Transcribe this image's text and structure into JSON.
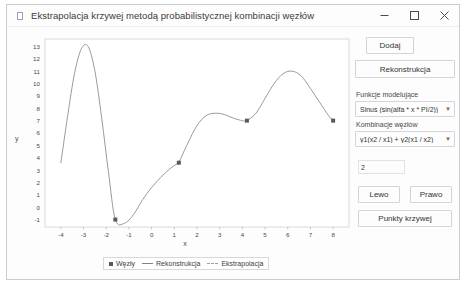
{
  "window": {
    "title": "Ekstrapolacja krzywej metodą probabilistycznej kombinacji węzłów",
    "app_icon": "app-icon",
    "controls": {
      "minimize": "minimize-icon",
      "maximize": "maximize-icon",
      "close": "close-icon"
    }
  },
  "panel": {
    "add_label": "Dodaj",
    "reconstruct_label": "Rekonstrukcja",
    "model_functions_label": "Funkcje modelujące",
    "model_functions_value": "Sinus (sin(alfa * x * PI/2))",
    "node_combination_label": "Kombinacje węzłów",
    "node_combination_value": "y1(x2 / x1) + y2(x1 / x2)",
    "spinner_value": "2",
    "left_label": "Lewo",
    "right_label": "Prawo",
    "curve_points_label": "Punkty krzywej",
    "dropdown_arrow": "chevron-down-icon"
  },
  "chart_data": {
    "type": "line",
    "title": "",
    "xlabel": "x",
    "ylabel": "y",
    "xlim": [
      -4.7,
      8.7
    ],
    "ylim": [
      -1.6,
      13.6
    ],
    "xticks": [
      -4,
      -3,
      -2,
      -1,
      0,
      1,
      2,
      3,
      4,
      5,
      6,
      7,
      8
    ],
    "yticks": [
      -1,
      0,
      1,
      2,
      3,
      4,
      5,
      6,
      7,
      8,
      9,
      10,
      11,
      12,
      13
    ],
    "grid": false,
    "legend_position": "bottom",
    "series": [
      {
        "name": "Węzły",
        "type": "scatter",
        "marker": "square",
        "color": "#555a60",
        "points": [
          {
            "x": -1.6,
            "y": -1.0
          },
          {
            "x": 1.2,
            "y": 3.6
          },
          {
            "x": 4.2,
            "y": 7.0
          },
          {
            "x": 8.0,
            "y": 7.0
          }
        ]
      },
      {
        "name": "Rekonstrukcja",
        "type": "line",
        "color": "#8a8f94",
        "x": [
          -4.0,
          -3.7,
          -3.4,
          -3.1,
          -2.8,
          -2.5,
          -2.2,
          -1.9,
          -1.6,
          -1.2,
          -0.8,
          -0.4,
          0.0,
          0.4,
          0.8,
          1.2
        ],
        "y": [
          3.6,
          7.4,
          10.8,
          12.8,
          13.0,
          11.0,
          7.2,
          2.8,
          -1.0,
          -1.3,
          -0.6,
          0.6,
          1.6,
          2.4,
          3.1,
          3.6
        ]
      },
      {
        "name": "Ekstrapolacja",
        "type": "line",
        "color": "#8a8f94",
        "x": [
          1.2,
          1.6,
          2.0,
          2.4,
          2.8,
          3.2,
          3.6,
          4.0,
          4.2,
          4.6,
          5.0,
          5.4,
          5.8,
          6.2,
          6.6,
          7.0,
          7.4,
          7.8,
          8.0
        ],
        "y": [
          3.6,
          5.2,
          6.6,
          7.4,
          7.6,
          7.5,
          7.2,
          7.0,
          7.0,
          7.6,
          8.8,
          10.0,
          10.8,
          11.0,
          10.6,
          9.6,
          8.5,
          7.4,
          7.0
        ]
      }
    ],
    "legend": [
      "Węzły",
      "Rekonstrukcja",
      "Ekstrapolacja"
    ]
  }
}
